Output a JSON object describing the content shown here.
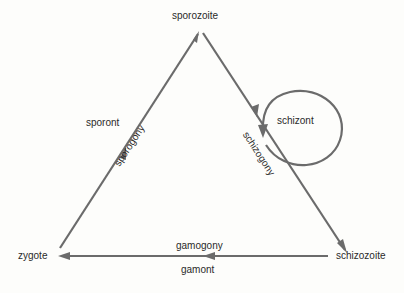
{
  "diagram": {
    "type": "life-cycle-triangle",
    "nodes": {
      "top": "sporozoite",
      "left": "zygote",
      "right": "schizozoite",
      "loop": "schizont",
      "left_edge_outer": "sporont"
    },
    "edges": {
      "left": "sporogony",
      "right": "schizogony",
      "bottom_top": "gamogony",
      "bottom_bottom": "gamont"
    },
    "line_color": "#6b6b6b"
  }
}
